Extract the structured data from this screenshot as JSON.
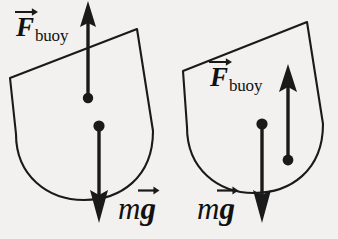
{
  "figure": {
    "kind": "physics-force-diagram",
    "background_color": "#f2f1ef",
    "ink_color": "#1a1a1a"
  },
  "labels": {
    "buoyant_symbol": "F",
    "buoyant_subscript": "buoy",
    "weight_mass_symbol": "m",
    "weight_gravity_symbol": "g"
  },
  "left_hull": {
    "name": "upright hull",
    "buoyant_label": {
      "symbol": "F",
      "subscript": "buoy"
    },
    "weight_label": {
      "mass": "m",
      "gravity": "g"
    },
    "buoyant_vector": {
      "direction": "up",
      "tail_x": 88,
      "tail_y": 98,
      "tip_x": 88,
      "tip_y": 2
    },
    "weight_vector": {
      "direction": "down",
      "tail_x": 99,
      "tail_y": 126,
      "tip_x": 99,
      "tip_y": 221
    },
    "center_of_buoyancy": {
      "x": 88,
      "y": 98
    },
    "center_of_gravity": {
      "x": 99,
      "y": 126
    }
  },
  "right_hull": {
    "name": "tilted hull with offset centers",
    "buoyant_label": {
      "symbol": "F",
      "subscript": "buoy"
    },
    "weight_label": {
      "mass": "m",
      "gravity": "g"
    },
    "buoyant_vector": {
      "direction": "up",
      "tail_x": 288,
      "tail_y": 160,
      "tip_x": 288,
      "tip_y": 68
    },
    "weight_vector": {
      "direction": "down",
      "tail_x": 262,
      "tail_y": 124,
      "tip_x": 262,
      "tip_y": 221
    },
    "center_of_buoyancy": {
      "x": 288,
      "y": 160
    },
    "center_of_gravity": {
      "x": 262,
      "y": 124
    }
  }
}
